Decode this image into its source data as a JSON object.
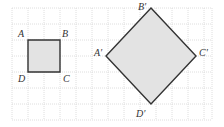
{
  "diagram": {
    "type": "geometric-transformation-grid",
    "grid": {
      "x0": 12,
      "y0": 8,
      "cell": 16,
      "cols": 12.5,
      "rows": 7,
      "line_color": "#d6d6d6"
    },
    "shapes": [
      {
        "name": "square-ABCD",
        "fill": "#e3e3e3",
        "stroke": "#333333",
        "points": [
          [
            28,
            40
          ],
          [
            60,
            40
          ],
          [
            60,
            72
          ],
          [
            28,
            72
          ]
        ],
        "vertices": [
          {
            "label": "A",
            "x": 18,
            "y": 37
          },
          {
            "label": "B",
            "x": 62,
            "y": 37
          },
          {
            "label": "C",
            "x": 63,
            "y": 82
          },
          {
            "label": "D",
            "x": 18,
            "y": 82
          }
        ]
      },
      {
        "name": "square-A'B'C'D'",
        "fill": "#e3e3e3",
        "stroke": "#333333",
        "points": [
          [
            151,
            8
          ],
          [
            196,
            56
          ],
          [
            151,
            104
          ],
          [
            106,
            56
          ]
        ],
        "vertices": [
          {
            "label": "A′",
            "x": 94,
            "y": 56
          },
          {
            "label": "B′",
            "x": 138,
            "y": 10
          },
          {
            "label": "C′",
            "x": 199,
            "y": 56
          },
          {
            "label": "D′",
            "x": 136,
            "y": 117
          }
        ]
      }
    ]
  }
}
